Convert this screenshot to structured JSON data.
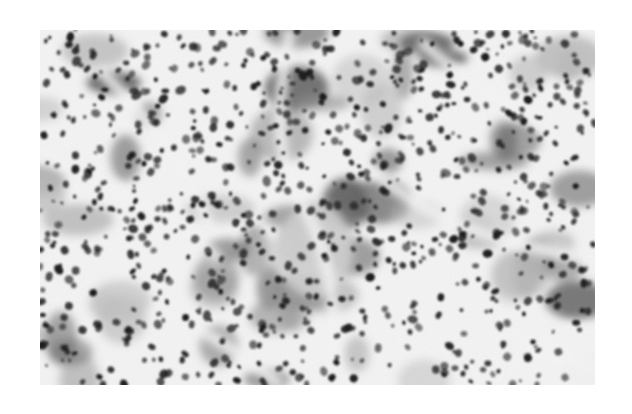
{
  "figure": {
    "kind": "grayscale histology micrograph",
    "bounds": {
      "x": 40,
      "y": 30,
      "width": 555,
      "height": 355
    },
    "colors": {
      "page_background": "#ffffff",
      "stroma": "#f4f4f4",
      "cytoplasm_light": "#bdbdbd",
      "cytoplasm_mid": "#8f8f8f",
      "cytoplasm_dark": "#5a5a5a",
      "nucleus": "#161616",
      "pale_area": "#cfcfcf"
    },
    "seed": 1337,
    "counts": {
      "clusters": 70,
      "nuclei": 900
    }
  }
}
